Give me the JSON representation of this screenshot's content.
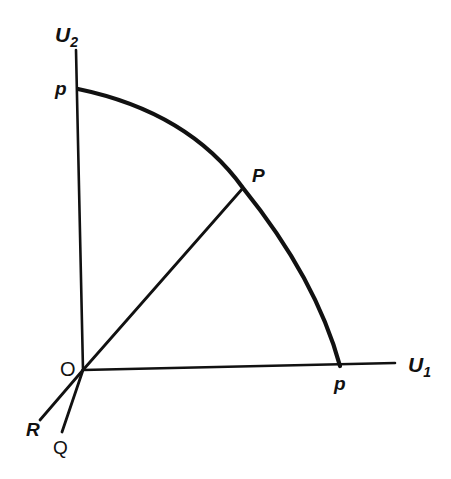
{
  "diagram": {
    "type": "utility-possibility-frontier",
    "axes": {
      "vertical": {
        "label": "U",
        "subscript": "2"
      },
      "horizontal": {
        "label": "U",
        "subscript": "1"
      }
    },
    "origin_label": "O",
    "frontier": {
      "intercept_vertical_label": "p",
      "intercept_horizontal_label": "p",
      "point_label": "P"
    },
    "rays": [
      {
        "label": "R"
      },
      {
        "label": "Q"
      }
    ],
    "colors": {
      "ink": "#111111",
      "background": "#ffffff"
    }
  }
}
